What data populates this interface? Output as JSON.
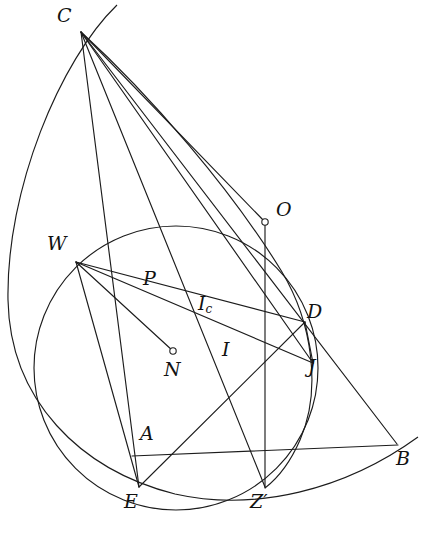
{
  "figure": {
    "stroke_color": "#1c1c1c",
    "background_color": "#ffffff",
    "label_color": "#111111"
  },
  "points": [
    {
      "id": "C",
      "label": "C",
      "x": 81,
      "y": 32,
      "label_x": 57,
      "label_y": 6,
      "marker": "none"
    },
    {
      "id": "O",
      "label": "O",
      "x": 265,
      "y": 222,
      "label_x": 276,
      "label_y": 200,
      "marker": "circle"
    },
    {
      "id": "W",
      "label": "W",
      "x": 76,
      "y": 262,
      "label_x": 47,
      "label_y": 234,
      "marker": "none"
    },
    {
      "id": "P",
      "label": "P",
      "x": 152,
      "y": 295,
      "label_x": 143,
      "label_y": 269,
      "marker": "none"
    },
    {
      "id": "Ic",
      "label": "I",
      "sub": "c",
      "x": 209,
      "y": 305,
      "label_x": 198,
      "label_y": 294,
      "marker": "none"
    },
    {
      "id": "D",
      "label": "D",
      "x": 305,
      "y": 322,
      "label_x": 307,
      "label_y": 302,
      "marker": "none"
    },
    {
      "id": "N",
      "label": "N",
      "x": 172,
      "y": 352,
      "label_x": 164,
      "label_y": 360,
      "marker": "circle"
    },
    {
      "id": "I",
      "label": "I",
      "x": 228,
      "y": 350,
      "label_x": 222,
      "label_y": 340,
      "marker": "none"
    },
    {
      "id": "J",
      "label": "J",
      "x": 313,
      "y": 363,
      "label_x": 308,
      "label_y": 357,
      "marker": "none"
    },
    {
      "id": "A",
      "label": "A",
      "x": 144,
      "y": 430,
      "label_x": 140,
      "label_y": 424,
      "marker": "none"
    },
    {
      "id": "B",
      "label": "B",
      "x": 397,
      "y": 444,
      "label_x": 396,
      "label_y": 449,
      "marker": "none"
    },
    {
      "id": "E",
      "label": "E",
      "x": 139,
      "y": 487,
      "label_x": 124,
      "label_y": 492,
      "marker": "none"
    },
    {
      "id": "Zp",
      "label": "Z′",
      "x": 265,
      "y": 487,
      "label_x": 250,
      "label_y": 492,
      "marker": "none"
    }
  ],
  "segments": [
    {
      "name": "C-to-E",
      "x1": 81,
      "y1": 32,
      "x2": 139,
      "y2": 487
    },
    {
      "name": "C-to-Zprime",
      "x1": 81,
      "y1": 32,
      "x2": 265,
      "y2": 487
    },
    {
      "name": "C-to-J",
      "x1": 81,
      "y1": 32,
      "x2": 313,
      "y2": 363
    },
    {
      "name": "C-to-B",
      "x1": 81,
      "y1": 32,
      "x2": 397,
      "y2": 444
    },
    {
      "name": "C-to-O",
      "x1": 81,
      "y1": 32,
      "x2": 265,
      "y2": 222
    },
    {
      "name": "O-to-Zprime",
      "x1": 265,
      "y1": 222,
      "x2": 265,
      "y2": 487
    },
    {
      "name": "A-to-B",
      "x1": 135,
      "y1": 456,
      "x2": 397,
      "y2": 444
    },
    {
      "name": "W-to-D",
      "x1": 76,
      "y1": 262,
      "x2": 305,
      "y2": 322
    },
    {
      "name": "W-to-J",
      "x1": 76,
      "y1": 262,
      "x2": 313,
      "y2": 363
    },
    {
      "name": "W-to-N",
      "x1": 76,
      "y1": 262,
      "x2": 172,
      "y2": 352
    },
    {
      "name": "D-to-E",
      "x1": 305,
      "y1": 322,
      "x2": 139,
      "y2": 487
    },
    {
      "name": "E-to-D-upper",
      "x1": 139,
      "y1": 487,
      "x2": 305,
      "y2": 322
    },
    {
      "name": "W-to-E",
      "x1": 76,
      "y1": 262,
      "x2": 139,
      "y2": 487
    }
  ],
  "circles": [
    {
      "name": "main-circle",
      "cx": 176,
      "cy": 368,
      "r": 142
    },
    {
      "name": "circumcircle",
      "cx": 268,
      "cy": 178,
      "r": 290
    },
    {
      "name": "arc-through-CD",
      "cx": 128,
      "cy": 172,
      "r": 330
    }
  ],
  "labels_meta": {
    "font_style": "italic serif",
    "label_count": 13
  }
}
